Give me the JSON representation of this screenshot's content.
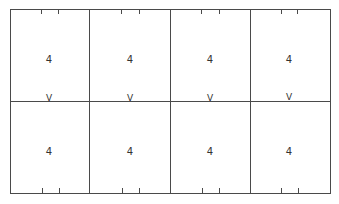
{
  "diagram": {
    "grid": {
      "rows": 2,
      "columns": 4
    },
    "cells": [
      {
        "row": 0,
        "col": 0,
        "label": "4"
      },
      {
        "row": 0,
        "col": 1,
        "label": "4"
      },
      {
        "row": 0,
        "col": 2,
        "label": "4"
      },
      {
        "row": 0,
        "col": 3,
        "label": "4"
      },
      {
        "row": 1,
        "col": 0,
        "label": "4"
      },
      {
        "row": 1,
        "col": 1,
        "label": "4"
      },
      {
        "row": 1,
        "col": 2,
        "label": "4"
      },
      {
        "row": 1,
        "col": 3,
        "label": "4"
      }
    ],
    "divider_marks": [
      "V",
      "V",
      "V",
      "V"
    ],
    "line_color": "#4a4a4a"
  }
}
